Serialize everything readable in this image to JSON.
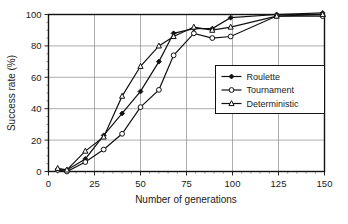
{
  "chart_data": {
    "type": "line",
    "title": "",
    "xlabel": "Number of generations",
    "ylabel": "Success rate (%)",
    "xlim": [
      0,
      150
    ],
    "ylim": [
      0,
      100
    ],
    "xticks": [
      0,
      25,
      50,
      75,
      100,
      125,
      150
    ],
    "yticks": [
      0,
      20,
      40,
      60,
      80,
      100
    ],
    "grid": true,
    "legend_position": "center-right",
    "series": [
      {
        "name": "Roulette",
        "marker": "filled-diamond",
        "x": [
          5,
          10,
          20,
          30,
          40,
          50,
          60,
          68,
          79,
          89,
          99,
          124,
          149
        ],
        "y": [
          1,
          1,
          8,
          23,
          37,
          51,
          70,
          88,
          91,
          91,
          98,
          100,
          101
        ]
      },
      {
        "name": "Tournament",
        "marker": "open-circle",
        "x": [
          5,
          10,
          20,
          30,
          40,
          50,
          60,
          68,
          79,
          89,
          99,
          124,
          149
        ],
        "y": [
          1,
          0,
          6,
          14,
          24,
          41,
          52,
          74,
          88,
          85,
          86,
          99,
          99
        ]
      },
      {
        "name": "Deterministic",
        "marker": "open-triangle",
        "x": [
          5,
          10,
          20,
          30,
          40,
          50,
          60,
          68,
          79,
          89,
          99,
          124,
          149
        ],
        "y": [
          2,
          1,
          13,
          22,
          48,
          67,
          80,
          86,
          92,
          90,
          92,
          99,
          100
        ]
      }
    ]
  },
  "legend": {
    "entries": [
      {
        "label": "Roulette"
      },
      {
        "label": "Tournament"
      },
      {
        "label": "Deterministic"
      }
    ]
  },
  "axes": {
    "y_tick_labels": [
      "0",
      "20",
      "40",
      "60",
      "80",
      "100"
    ],
    "x_tick_labels": [
      "0",
      "25",
      "50",
      "75",
      "100",
      "125",
      "150"
    ],
    "x_axis_title": "Number of generations",
    "y_axis_title": "Success rate (%)"
  },
  "colors": {
    "ink": "#111111",
    "grid": "#8a8a8a",
    "background": "#ffffff"
  }
}
